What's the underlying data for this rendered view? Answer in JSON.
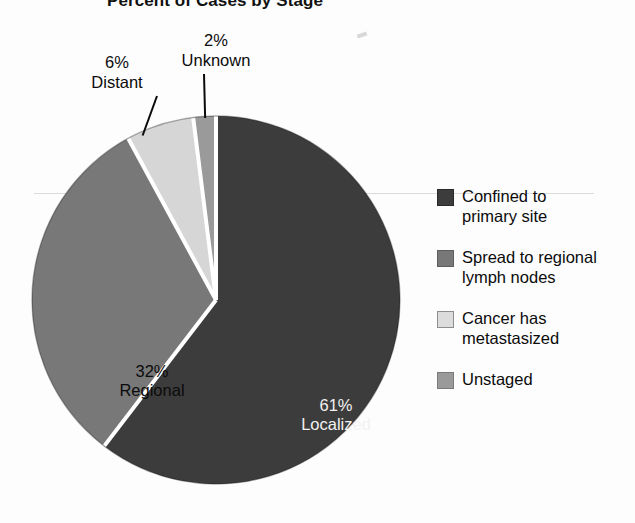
{
  "chart_data": {
    "type": "pie",
    "title": "Percent of Cases by Stage",
    "xlabel": "",
    "ylabel": "",
    "legend_position": "right",
    "grid": false,
    "start_angle_deg": 0,
    "direction": "clockwise",
    "categories": [
      "Localized",
      "Regional",
      "Distant",
      "Unknown"
    ],
    "values": [
      61,
      32,
      6,
      2
    ],
    "slices": [
      {
        "name": "Localized",
        "value": 61,
        "percent_label": "61%",
        "stage_label": "Localized",
        "color": "#3c3c3c",
        "label_style": "inside",
        "label_color": "#f2f2f2",
        "legend_label": "Confined to primary site"
      },
      {
        "name": "Regional",
        "value": 32,
        "percent_label": "32%",
        "stage_label": "Regional",
        "color": "#787878",
        "label_style": "inside",
        "label_color": "#0b0b0b",
        "legend_label": "Spread to regional lymph nodes"
      },
      {
        "name": "Distant",
        "value": 6,
        "percent_label": "6%",
        "stage_label": "Distant",
        "color": "#d6d6d6",
        "label_style": "callout",
        "label_color": "#0b0b0b",
        "legend_label": "Cancer has metastasized"
      },
      {
        "name": "Unknown",
        "value": 2,
        "percent_label": "2%",
        "stage_label": "Unknown",
        "color": "#9a9a9a",
        "label_style": "callout",
        "label_color": "#0b0b0b",
        "legend_label": "Unstaged"
      }
    ]
  },
  "title": "Percent of Cases by Stage",
  "pie_labels": {
    "localized_percent": "61%",
    "localized_name": "Localized",
    "regional_percent": "32%",
    "regional_name": "Regional",
    "distant_percent": "6%",
    "distant_name": "Distant",
    "unknown_percent": "2%",
    "unknown_name": "Unknown"
  },
  "legend": {
    "items": [
      {
        "label_line1": "Confined to",
        "label_line2": "primary site",
        "color": "#3c3c3c"
      },
      {
        "label_line1": "Spread to regional",
        "label_line2": "lymph nodes",
        "color": "#787878"
      },
      {
        "label_line1": "Cancer has",
        "label_line2": "metastasized",
        "color": "#dcdcdc"
      },
      {
        "label_line1": "Unstaged",
        "label_line2": "",
        "color": "#9a9a9a"
      }
    ]
  }
}
